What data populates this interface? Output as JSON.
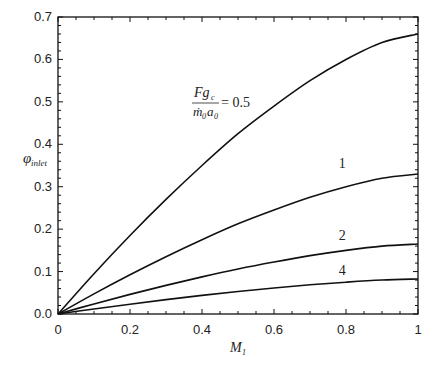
{
  "chart_data": {
    "type": "line",
    "title": "",
    "xlabel": "M_1",
    "ylabel": "φ_inlet",
    "xlim": [
      0,
      1
    ],
    "ylim": [
      0,
      0.7
    ],
    "grid": false,
    "x_ticks": [
      "0",
      "0.2",
      "0.4",
      "0.6",
      "0.8",
      "1"
    ],
    "y_ticks": [
      "0.0",
      "0.1",
      "0.2",
      "0.3",
      "0.4",
      "0.5",
      "0.6",
      "0.7"
    ],
    "annotation": {
      "numerator": "Fg",
      "num_sub": "c",
      "denominator": "ṁ",
      "den_sub": "0",
      "den2": "a",
      "den2_sub": "0",
      "equals": "= 0.5"
    },
    "x": [
      0,
      0.1,
      0.2,
      0.3,
      0.4,
      0.5,
      0.6,
      0.7,
      0.8,
      0.9,
      1.0
    ],
    "series": [
      {
        "name": "0.5",
        "label": "= 0.5",
        "values": [
          0,
          0.095,
          0.185,
          0.27,
          0.35,
          0.425,
          0.49,
          0.55,
          0.6,
          0.64,
          0.66
        ]
      },
      {
        "name": "1",
        "label": "1",
        "values": [
          0,
          0.0475,
          0.0925,
          0.135,
          0.175,
          0.2125,
          0.245,
          0.275,
          0.3,
          0.32,
          0.33
        ]
      },
      {
        "name": "2",
        "label": "2",
        "values": [
          0,
          0.0238,
          0.0463,
          0.0675,
          0.0875,
          0.106,
          0.1225,
          0.1375,
          0.15,
          0.16,
          0.165
        ]
      },
      {
        "name": "4",
        "label": "4",
        "values": [
          0,
          0.0119,
          0.0231,
          0.0338,
          0.0438,
          0.0531,
          0.0613,
          0.0688,
          0.075,
          0.08,
          0.0825
        ]
      }
    ]
  }
}
